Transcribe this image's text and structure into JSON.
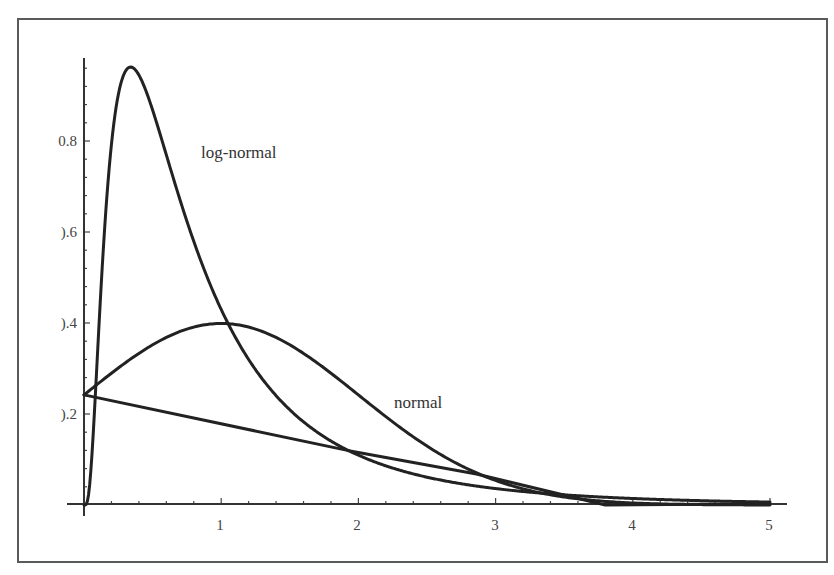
{
  "chart_data": {
    "type": "line",
    "title": "",
    "xlabel": "",
    "ylabel": "",
    "xlim": [
      -0.12,
      5.13
    ],
    "ylim": [
      -0.025,
      0.98
    ],
    "grid": false,
    "legend": "none (inline curve labels)",
    "x_ticks": [
      1,
      2,
      3,
      4,
      5
    ],
    "x_tick_labels": [
      "1",
      "2",
      "3",
      "4",
      "5"
    ],
    "x_minor_step": 0.2,
    "y_ticks": [
      0.2,
      0.4,
      0.6,
      0.8
    ],
    "y_tick_labels": [
      "0.2",
      "0.4",
      "0.6",
      "0.8"
    ],
    "y_tick_labels_rendered": [
      ").2",
      ").4",
      ").6",
      "0.8"
    ],
    "y_minor_step": 0.04,
    "series": [
      {
        "name": "log-normal",
        "kind": "lognormal-pdf",
        "params": {
          "mu": -0.357,
          "sigma": 0.85
        },
        "x": [
          0,
          0.1,
          0.2,
          0.3,
          0.34,
          0.4,
          0.5,
          0.6,
          0.8,
          1.0,
          1.2,
          1.5,
          2.0,
          2.5,
          3.0,
          3.5,
          4.0,
          4.5,
          5.0
        ],
        "values": [
          0,
          0.29,
          0.79,
          0.95,
          0.96,
          0.95,
          0.86,
          0.76,
          0.57,
          0.42,
          0.31,
          0.2,
          0.11,
          0.06,
          0.035,
          0.02,
          0.012,
          0.008,
          0.005
        ]
      },
      {
        "name": "normal",
        "kind": "normal-pdf",
        "params": {
          "mean": 1,
          "sd": 1
        },
        "x": [
          0,
          0.5,
          1.0,
          1.5,
          2.0,
          2.5,
          3.0,
          3.5,
          4.0,
          4.5,
          5.0
        ],
        "values": [
          0.242,
          0.352,
          0.399,
          0.352,
          0.242,
          0.13,
          0.054,
          0.018,
          0.004,
          0.001,
          0.0001
        ]
      },
      {
        "name": "linear",
        "kind": "straight-line",
        "x": [
          0,
          1.92,
          2.86,
          3.8
        ],
        "values": [
          0.242,
          0.12,
          0.068,
          0.0
        ]
      }
    ],
    "annotations": [
      {
        "text": "log-normal",
        "x": 0.86,
        "y": 0.77
      },
      {
        "text": "normal",
        "x": 2.27,
        "y": 0.23
      }
    ]
  },
  "labels": {
    "lognormal": "log-normal",
    "normal": "normal"
  },
  "axis": {
    "x": [
      "1",
      "2",
      "3",
      "4",
      "5"
    ],
    "y": [
      ").2",
      ").4",
      ").6",
      "0.8"
    ]
  }
}
